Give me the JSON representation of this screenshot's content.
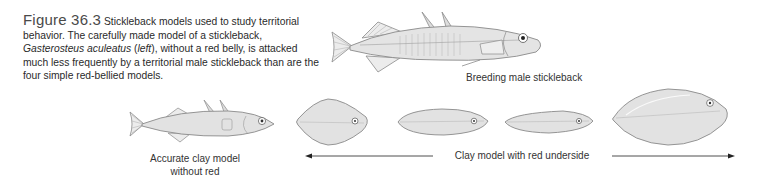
{
  "caption": {
    "figure_number": "Figure 36.3",
    "text_part1": "Stickleback models used to study territorial behavior. The carefully made model of a stickleback, ",
    "species": "Gasterosteus aculeatus",
    "text_part2": " (",
    "left": "left",
    "text_part3": "), without a red belly, is attacked much less frequently by a territorial male stickleback than are the four simple red-bellied models."
  },
  "illustrations": {
    "breeding_male": {
      "label": "Breeding male stickleback"
    },
    "accurate_model": {
      "label_line1": "Accurate clay model",
      "label_line2": "without red"
    },
    "red_models": {
      "label": "Clay model with red underside",
      "count": 4
    }
  },
  "colors": {
    "fish_fill": "#e4e4e4",
    "fish_stroke": "#8a8a8a",
    "model_fill": "#e2e2e2",
    "arrow": "#222222",
    "caption_text": "#2a2a2a"
  }
}
